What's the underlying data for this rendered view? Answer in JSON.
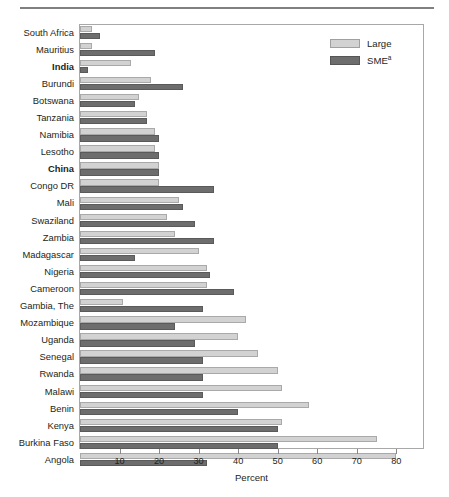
{
  "chart_data": {
    "type": "bar",
    "orientation": "horizontal",
    "title": "",
    "xlabel": "Percent",
    "ylabel": "",
    "xlim": [
      0,
      87
    ],
    "xticks": [
      10,
      20,
      30,
      40,
      50,
      60,
      70,
      80
    ],
    "grid": false,
    "legend_position": "top-right",
    "legend": [
      "Large",
      "SME"
    ],
    "legend_entries": [
      {
        "label": "Large",
        "color": "#d2d2d2",
        "superscript": ""
      },
      {
        "label": "SME",
        "color": "#6d6d6d",
        "superscript": "a"
      }
    ],
    "categories": [
      "South Africa",
      "Mauritius",
      "India",
      "Burundi",
      "Botswana",
      "Tanzania",
      "Namibia",
      "Lesotho",
      "China",
      "Congo DR",
      "Mali",
      "Swaziland",
      "Zambia",
      "Madagascar",
      "Nigeria",
      "Cameroon",
      "Gambia, The",
      "Mozambique",
      "Uganda",
      "Senegal",
      "Rwanda",
      "Malawi",
      "Benin",
      "Kenya",
      "Burkina Faso",
      "Angola"
    ],
    "highlighted_categories": [
      "India",
      "China"
    ],
    "series": [
      {
        "name": "Large",
        "color": "#d2d2d2",
        "values": [
          3,
          3,
          13,
          18,
          15,
          17,
          19,
          19,
          20,
          20,
          25,
          22,
          24,
          30,
          32,
          32,
          11,
          42,
          40,
          45,
          50,
          51,
          58,
          51,
          75,
          80
        ]
      },
      {
        "name": "SME",
        "color": "#6d6d6d",
        "values": [
          5,
          19,
          2,
          26,
          14,
          17,
          20,
          20,
          20,
          34,
          26,
          29,
          34,
          14,
          33,
          39,
          31,
          24,
          29,
          31,
          31,
          31,
          40,
          50,
          50,
          32
        ]
      }
    ]
  },
  "axis": {
    "x_title": "Percent"
  }
}
